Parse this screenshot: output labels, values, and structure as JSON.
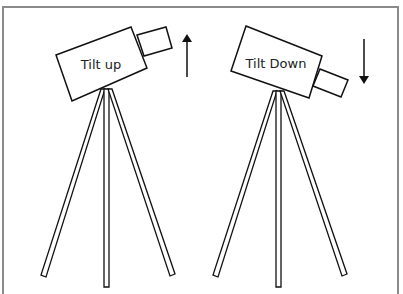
{
  "diagram": {
    "panels": [
      {
        "id": "tilt-up",
        "label": "Tilt up",
        "arrow_direction": "up"
      },
      {
        "id": "tilt-down",
        "label": "Tilt Down",
        "arrow_direction": "down"
      }
    ],
    "colors": {
      "stroke": "#111111",
      "frame": "#8a8a8a",
      "background": "#ffffff"
    }
  }
}
